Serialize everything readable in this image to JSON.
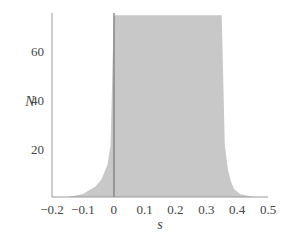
{
  "chart_data": {
    "type": "area",
    "title": "",
    "xlabel": "s",
    "ylabel": "N",
    "xlim": [
      -0.2,
      0.5
    ],
    "ylim": [
      0,
      75
    ],
    "grid": false,
    "legend": null,
    "x_ticks": [
      "−0.2",
      "−0.1",
      "0",
      "0.1",
      "0.2",
      "0.3",
      "0.4",
      "0.5"
    ],
    "x_tick_values": [
      -0.2,
      -0.1,
      0,
      0.1,
      0.2,
      0.3,
      0.4,
      0.5
    ],
    "y_ticks": [
      "20",
      "40",
      "60"
    ],
    "y_tick_values": [
      20,
      40,
      60
    ],
    "series": [
      {
        "name": "N(s) distribution",
        "color": "#c8c8c8",
        "x": [
          -0.2,
          -0.15,
          -0.1,
          -0.06,
          -0.04,
          -0.02,
          -0.01,
          0.0,
          0.35,
          0.36,
          0.37,
          0.38,
          0.39,
          0.41,
          0.45,
          0.5
        ],
        "values": [
          0,
          0.5,
          2,
          5,
          8,
          14,
          22,
          75,
          75,
          22,
          12,
          7,
          4,
          2,
          0.5,
          0
        ]
      }
    ],
    "annotations": [
      {
        "type": "vline",
        "x": 0,
        "color": "#777777"
      }
    ]
  },
  "axes": {
    "x_label": "s",
    "y_label": "N"
  }
}
